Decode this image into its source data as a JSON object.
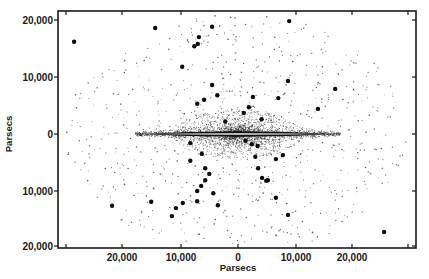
{
  "chart_data": {
    "type": "scatter",
    "title": "",
    "xlabel": "Parsecs",
    "ylabel": "Parsecs",
    "xlim": [
      -29000,
      31000
    ],
    "ylim": [
      -20500,
      21500
    ],
    "grid": false,
    "legend": null,
    "x_ticks": [
      {
        "value": -20000,
        "label": "20,000"
      },
      {
        "value": -10000,
        "label": "10,000"
      },
      {
        "value": 0,
        "label": "0"
      },
      {
        "value": 10000,
        "label": "10,000"
      },
      {
        "value": 20000,
        "label": "20,000"
      }
    ],
    "y_ticks": [
      {
        "value": 20000,
        "label": "20,000"
      },
      {
        "value": 10000,
        "label": "10,000"
      },
      {
        "value": 0,
        "label": "0"
      },
      {
        "value": -10000,
        "label": "10,000"
      },
      {
        "value": -20000,
        "label": "20,000"
      }
    ],
    "components": {
      "galactic_disk": {
        "half_length_pc": 17000,
        "thickness_pc": 600
      },
      "central_bulge": {
        "half_length_pc": 9000,
        "half_height_pc": 3200
      },
      "halo_stars": {
        "description": "small dots, elliptical distribution",
        "semi_major_pc": 30000,
        "semi_minor_pc": 21000
      }
    },
    "series": [
      {
        "name": "Globular clusters (large dots)",
        "points": [
          {
            "x": -28500,
            "y": 16200
          },
          {
            "x": -14400,
            "y": 18600
          },
          {
            "x": -6800,
            "y": 17000
          },
          {
            "x": -7000,
            "y": 15800
          },
          {
            "x": -7600,
            "y": 15400
          },
          {
            "x": -4500,
            "y": 18800
          },
          {
            "x": 8900,
            "y": 19800
          },
          {
            "x": -9700,
            "y": 11800
          },
          {
            "x": -4500,
            "y": 8600
          },
          {
            "x": -3600,
            "y": 6800
          },
          {
            "x": -5900,
            "y": 6000
          },
          {
            "x": -7100,
            "y": 5300
          },
          {
            "x": 2600,
            "y": 6500
          },
          {
            "x": 7000,
            "y": 6300
          },
          {
            "x": 8700,
            "y": 9300
          },
          {
            "x": 16900,
            "y": 7900
          },
          {
            "x": 13900,
            "y": 4400
          },
          {
            "x": 1900,
            "y": 4700
          },
          {
            "x": 1000,
            "y": 3700
          },
          {
            "x": -8300,
            "y": -1600
          },
          {
            "x": -6300,
            "y": -3500
          },
          {
            "x": -8300,
            "y": -4700
          },
          {
            "x": -5700,
            "y": -6000
          },
          {
            "x": -5000,
            "y": -7000
          },
          {
            "x": -5700,
            "y": -8100
          },
          {
            "x": -6400,
            "y": -9100
          },
          {
            "x": -7100,
            "y": -10000
          },
          {
            "x": -9600,
            "y": -12100
          },
          {
            "x": -10800,
            "y": -13000
          },
          {
            "x": -4300,
            "y": -10400
          },
          {
            "x": -3500,
            "y": -12500
          },
          {
            "x": -7100,
            "y": -11800
          },
          {
            "x": -15100,
            "y": -11900
          },
          {
            "x": -21900,
            "y": -12600
          },
          {
            "x": -11500,
            "y": -14400
          },
          {
            "x": 3500,
            "y": -6000
          },
          {
            "x": 6600,
            "y": -4400
          },
          {
            "x": 7800,
            "y": -3700
          },
          {
            "x": 3000,
            "y": -4000
          },
          {
            "x": 4200,
            "y": -7700
          },
          {
            "x": 5200,
            "y": -8100
          },
          {
            "x": 4900,
            "y": -8200
          },
          {
            "x": 6600,
            "y": -11200
          },
          {
            "x": 8700,
            "y": -14200
          },
          {
            "x": 25400,
            "y": -17200
          },
          {
            "x": 1300,
            "y": -1200
          },
          {
            "x": 2400,
            "y": -1800
          },
          {
            "x": 3400,
            "y": -2100
          },
          {
            "x": -2200,
            "y": 2200
          },
          {
            "x": 4100,
            "y": 2600
          }
        ]
      }
    ]
  }
}
